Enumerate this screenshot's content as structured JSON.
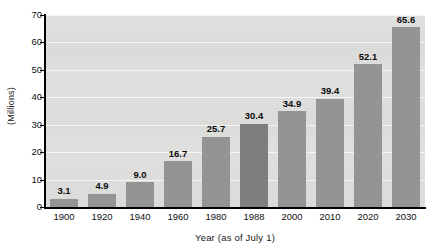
{
  "chart_data": {
    "type": "bar",
    "title": "",
    "subtitle": "",
    "xlabel": "Year (as of July 1)",
    "ylabel": "(Millions)",
    "categories": [
      "1900",
      "1920",
      "1940",
      "1960",
      "1980",
      "1988",
      "2000",
      "2010",
      "2020",
      "2030"
    ],
    "values": [
      3.1,
      4.9,
      9.0,
      16.7,
      25.7,
      30.4,
      34.9,
      39.4,
      52.1,
      65.6
    ],
    "value_labels": [
      "3.1",
      "4.9",
      "9.0",
      "16.7",
      "25.7",
      "30.4",
      "34.9",
      "39.4",
      "52.1",
      "65.6"
    ],
    "ylim": [
      0,
      70
    ],
    "ytick_values": [
      0,
      10,
      20,
      30,
      40,
      50,
      60,
      70
    ],
    "ytick_labels": [
      "0",
      "10",
      "20",
      "30",
      "40",
      "50",
      "60",
      "70"
    ],
    "grid": "horizontal",
    "legend": "none",
    "highlight_category": "1988",
    "colors": {
      "bar": "#949492",
      "bar_highlight": "#7e7e7c",
      "plot_background": "#dededc",
      "gridline": "#f6f6f4",
      "axis": "#000000",
      "text": "#111111",
      "page_background": "#ffffff"
    }
  }
}
